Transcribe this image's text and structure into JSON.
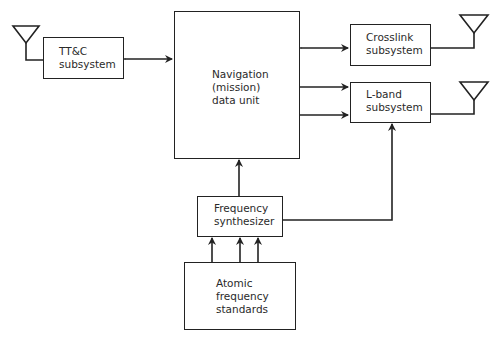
{
  "diagram": {
    "type": "block-diagram",
    "blocks": {
      "ttc": {
        "label_line1": "TT&C",
        "label_line2": "subsystem"
      },
      "nav": {
        "label_line1": "Navigation",
        "label_line2": "(mission)",
        "label_line3": "data unit"
      },
      "crosslink": {
        "label_line1": "Crosslink",
        "label_line2": "subsystem"
      },
      "lband": {
        "label_line1": "L-band",
        "label_line2": "subsystem"
      },
      "synth": {
        "label_line1": "Frequency",
        "label_line2": "synthesizer"
      },
      "atomic": {
        "label_line1": "Atomic",
        "label_line2": "frequency",
        "label_line3": "standards"
      }
    },
    "connections": [
      {
        "from": "ttc",
        "to": "nav",
        "direction": "bidirectional"
      },
      {
        "from": "nav",
        "to": "crosslink",
        "direction": "bidirectional"
      },
      {
        "from": "nav",
        "to": "lband",
        "direction": "forward",
        "count": 2
      },
      {
        "from": "synth",
        "to": "nav",
        "direction": "forward"
      },
      {
        "from": "synth",
        "to": "lband",
        "direction": "forward"
      },
      {
        "from": "atomic",
        "to": "synth",
        "direction": "forward",
        "count": 3
      }
    ],
    "antennas": [
      "ttc-antenna",
      "crosslink-antenna",
      "lband-antenna"
    ],
    "colors": {
      "line": "#222222",
      "text": "#2a2a2a",
      "background": "#ffffff"
    }
  }
}
